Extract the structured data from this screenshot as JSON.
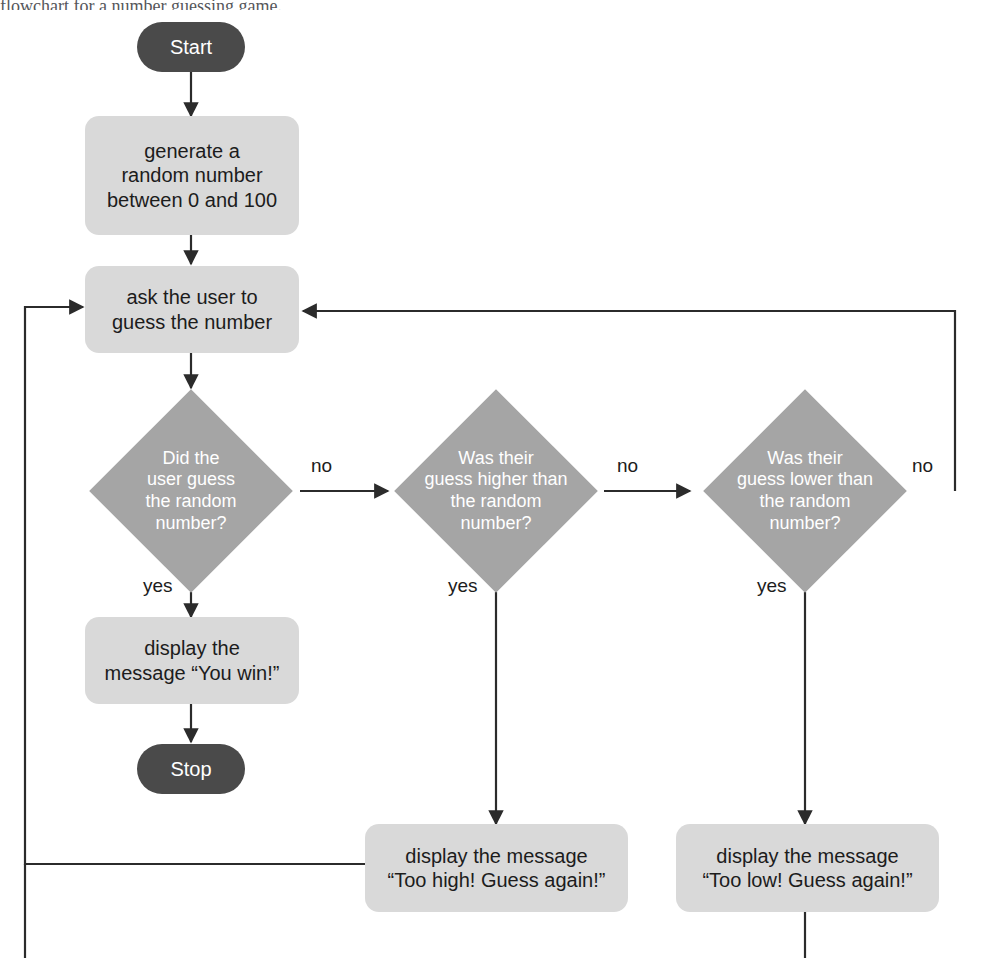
{
  "page": {
    "caption_fragment": "flowchart for a number guessing game.",
    "canvas_width": 983,
    "canvas_height": 958
  },
  "colors": {
    "background": "#ffffff",
    "terminator_fill": "#4a4a4a",
    "terminator_text": "#ffffff",
    "process_fill": "#d9d9d9",
    "process_text": "#1c1c1c",
    "decision_fill": "#a5a5a5",
    "decision_text": "#ffffff",
    "connector": "#2b2b2b"
  },
  "nodes": {
    "start": {
      "label": "Start",
      "type": "terminator"
    },
    "generate": {
      "label": "generate a\nrandom number\nbetween 0 and 100",
      "type": "process"
    },
    "ask": {
      "label": "ask the user to\nguess the number",
      "type": "process"
    },
    "decision_correct": {
      "label": "Did the\nuser guess\nthe random\nnumber?",
      "type": "decision"
    },
    "decision_higher": {
      "label": "Was their\nguess higher than\nthe random\nnumber?",
      "type": "decision"
    },
    "decision_lower": {
      "label": "Was their\nguess lower than\nthe random\nnumber?",
      "type": "decision"
    },
    "win": {
      "label": "display the\nmessage “You win!”",
      "type": "process"
    },
    "stop": {
      "label": "Stop",
      "type": "terminator"
    },
    "too_high": {
      "label": "display the message\n“Too high! Guess again!”",
      "type": "process"
    },
    "too_low": {
      "label": "display the message\n“Too low! Guess again!”",
      "type": "process"
    }
  },
  "edge_labels": {
    "correct_no": "no",
    "correct_yes": "yes",
    "higher_no": "no",
    "higher_yes": "yes",
    "lower_no": "no",
    "lower_yes": "yes"
  }
}
